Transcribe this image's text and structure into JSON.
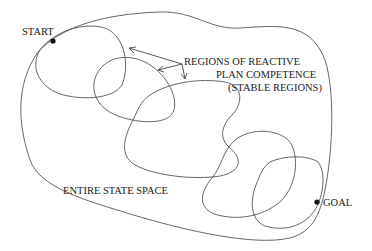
{
  "diagram": {
    "labels": {
      "start": "START",
      "goal": "GOAL",
      "regions_line1": "REGIONS OF REACTIVE",
      "regions_line2": "PLAN COMPETENCE",
      "regions_line3": "(STABLE REGIONS)",
      "state_space": "ENTIRE STATE SPACE"
    },
    "colors": {
      "stroke": "#555555",
      "text": "#222222",
      "dot": "#111111",
      "background": "#ffffff"
    },
    "nodes": [
      {
        "id": "start",
        "label": "START",
        "x": 53,
        "y": 41
      },
      {
        "id": "goal",
        "label": "GOAL",
        "x": 317,
        "y": 202
      }
    ],
    "regions": [
      {
        "id": "outer",
        "label": "ENTIRE STATE SPACE"
      },
      {
        "id": "region-1"
      },
      {
        "id": "region-2"
      },
      {
        "id": "region-3"
      },
      {
        "id": "region-4"
      },
      {
        "id": "region-5"
      }
    ]
  }
}
